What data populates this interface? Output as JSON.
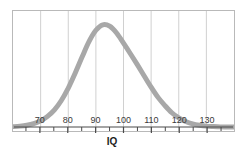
{
  "chart_data": {
    "type": "line",
    "title": "",
    "subtitle": "",
    "xlabel": "IQ",
    "ylabel": "",
    "xlim": [
      60,
      140
    ],
    "ylim": [
      0,
      1
    ],
    "grid": true,
    "legend": null,
    "curve_color": "#a8a8a8",
    "grid_color": "#cfcfcf",
    "frame_color": "#b9b9b9",
    "axis_color": "#4a4a4a",
    "label_color": "#3a3a3a",
    "distribution": {
      "kind": "normal-bell-curve",
      "mean": 100,
      "std_dev": 15,
      "peak_x": 100,
      "peak_y": 1.0
    },
    "x_ticks_major": [
      70,
      80,
      90,
      100,
      110,
      120,
      130
    ],
    "x_tick_labels": [
      "70",
      "80",
      "90",
      "100",
      "110",
      "120",
      "130"
    ],
    "x_ticks_minor": [
      65,
      75,
      85,
      95,
      105,
      115,
      125,
      135
    ],
    "gridline_x_values": [
      70,
      80,
      90,
      100,
      110,
      120,
      130
    ],
    "x": [
      60,
      62.5,
      65,
      67.5,
      70,
      72.5,
      75,
      77.5,
      80,
      82.5,
      85,
      87.5,
      90,
      92.5,
      95,
      97.5,
      100,
      102.5,
      105,
      107.5,
      110,
      112.5,
      115,
      117.5,
      120,
      122.5,
      125,
      127.5,
      130,
      132.5,
      135,
      137.5,
      140
    ],
    "y": [
      0.004,
      0.009,
      0.018,
      0.034,
      0.061,
      0.105,
      0.169,
      0.26,
      0.381,
      0.527,
      0.684,
      0.835,
      0.946,
      1.0,
      0.986,
      0.919,
      0.82,
      0.717,
      0.61,
      0.5,
      0.39,
      0.29,
      0.21,
      0.14,
      0.09,
      0.055,
      0.032,
      0.018,
      0.009,
      0.005,
      0.002,
      0.001,
      0.0
    ]
  }
}
